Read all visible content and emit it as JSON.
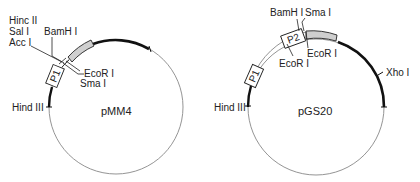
{
  "plasmids": [
    {
      "name": "pMM4",
      "promoter_boxes": [
        "P1"
      ],
      "sites": {
        "hinc": "Hinc II",
        "sal": "Sal I",
        "acc": "Acc I",
        "bamh": "BamH I",
        "ecor": "EcoR I",
        "sma": "Sma I",
        "hind": "Hind III"
      }
    },
    {
      "name": "pGS20",
      "promoter_boxes": [
        "P1",
        "P2"
      ],
      "sites": {
        "bamh": "BamH I",
        "sma": "Sma I",
        "ecor_outer": "EcoR I",
        "ecor_inner": "EcoR I",
        "xho": "Xho I",
        "hind": "Hind III"
      }
    }
  ],
  "colors": {
    "thin_line": "#777777",
    "thick_line": "#111111",
    "insert_fill": "#cfcfcf",
    "text": "#222222"
  }
}
